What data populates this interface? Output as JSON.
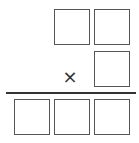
{
  "diagram": {
    "type": "multiplication-puzzle",
    "multiplicand": {
      "digits": [
        "",
        ""
      ]
    },
    "multiplier": {
      "digits": [
        ""
      ]
    },
    "operator": "×",
    "product": {
      "digits": [
        "",
        "",
        ""
      ]
    },
    "colors": {
      "border": "#555555",
      "rule": "#333333",
      "background": "#ffffff"
    }
  }
}
